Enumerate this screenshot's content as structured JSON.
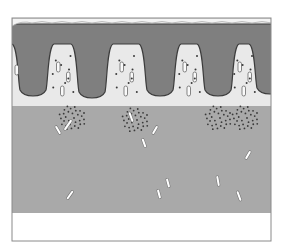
{
  "diagram": {
    "type": "tissue-cross-section",
    "canvas": {
      "width": 282,
      "height": 247
    },
    "frame": {
      "x": 12,
      "y": 18,
      "width": 259,
      "height": 223,
      "stroke": "#8a8a8a"
    },
    "colors": {
      "background": "#ffffff",
      "surface_layer": "#f4f4f4",
      "upper_dark_layer": "#7f7f7f",
      "villus_outline": "#3c3c3c",
      "lamina_light": "#e9e9e9",
      "lower_band": "#a9a9a9",
      "bottom_blank": "#ffffff",
      "dot": "#3a3a3a",
      "rod": "#ffffff"
    },
    "layers": [
      {
        "name": "surface-membrane",
        "y": 18,
        "height": 8
      },
      {
        "name": "dark-epithelium",
        "y": 26,
        "height": 16
      },
      {
        "name": "light-lamina-with-villi",
        "y": 42,
        "height": 64
      },
      {
        "name": "grey-submucosa",
        "y": 106,
        "height": 107
      },
      {
        "name": "blank-base",
        "y": 213,
        "height": 28
      }
    ],
    "villi_count": 5,
    "dark_projections": [
      {
        "cx": 33,
        "bottom": 96
      },
      {
        "cx": 92,
        "bottom": 98
      },
      {
        "cx": 160,
        "bottom": 96
      },
      {
        "cx": 218,
        "bottom": 96
      },
      {
        "cx": 270,
        "bottom": 94
      }
    ],
    "dot_clusters": [
      {
        "cx": 72,
        "cy": 118
      },
      {
        "cx": 135,
        "cy": 120
      },
      {
        "cx": 218,
        "cy": 118
      },
      {
        "cx": 245,
        "cy": 118
      }
    ],
    "rods": [
      {
        "x": 68,
        "y": 125,
        "angle": -55,
        "len": 10
      },
      {
        "x": 58,
        "y": 130,
        "angle": 60,
        "len": 7
      },
      {
        "x": 131,
        "y": 117,
        "angle": 70,
        "len": 8
      },
      {
        "x": 155,
        "y": 130,
        "angle": -60,
        "len": 7
      },
      {
        "x": 144,
        "y": 143,
        "angle": 70,
        "len": 7
      },
      {
        "x": 248,
        "y": 155,
        "angle": -60,
        "len": 7
      },
      {
        "x": 70,
        "y": 195,
        "angle": -55,
        "len": 8
      },
      {
        "x": 168,
        "y": 183,
        "angle": 75,
        "len": 7
      },
      {
        "x": 159,
        "y": 194,
        "angle": 75,
        "len": 7
      },
      {
        "x": 218,
        "y": 181,
        "angle": 80,
        "len": 8
      },
      {
        "x": 239,
        "y": 196,
        "angle": 70,
        "len": 8
      }
    ]
  }
}
